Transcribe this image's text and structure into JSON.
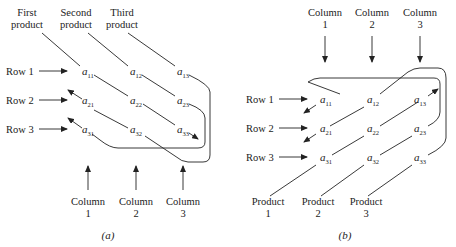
{
  "panel_a": {
    "caption": "(a)",
    "top_labels": [
      {
        "line1": "First",
        "line2": "product"
      },
      {
        "line1": "Second",
        "line2": "product"
      },
      {
        "line1": "Third",
        "line2": "product"
      }
    ],
    "row_labels": [
      "Row 1",
      "Row 2",
      "Row 3"
    ],
    "bottom_labels": [
      {
        "line1": "Column",
        "line2": "1"
      },
      {
        "line1": "Column",
        "line2": "2"
      },
      {
        "line1": "Column",
        "line2": "3"
      }
    ],
    "elements": [
      [
        "11",
        "12",
        "13"
      ],
      [
        "21",
        "22",
        "23"
      ],
      [
        "31",
        "32",
        "33"
      ]
    ]
  },
  "panel_b": {
    "caption": "(b)",
    "top_labels": [
      {
        "line1": "Column",
        "line2": "1"
      },
      {
        "line1": "Column",
        "line2": "2"
      },
      {
        "line1": "Column",
        "line2": "3"
      }
    ],
    "row_labels": [
      "Row 1",
      "Row 2",
      "Row 3"
    ],
    "bottom_labels": [
      {
        "line1": "Product",
        "line2": "1"
      },
      {
        "line1": "Product",
        "line2": "2"
      },
      {
        "line1": "Product",
        "line2": "3"
      }
    ],
    "elements": [
      [
        "11",
        "12",
        "13"
      ],
      [
        "21",
        "22",
        "23"
      ],
      [
        "31",
        "32",
        "33"
      ]
    ]
  },
  "element_symbol": "a"
}
